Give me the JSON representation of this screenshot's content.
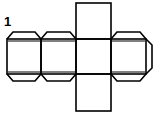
{
  "figure": {
    "label": "1",
    "stroke_color": "#000000",
    "background": "#ffffff"
  },
  "faces": [
    {
      "id": "face-top",
      "x": 76,
      "y": 3,
      "w": 35,
      "h": 36
    },
    {
      "id": "face-1",
      "x": 7,
      "y": 39,
      "w": 34,
      "h": 35
    },
    {
      "id": "face-2",
      "x": 41,
      "y": 39,
      "w": 35,
      "h": 35
    },
    {
      "id": "face-3",
      "x": 76,
      "y": 39,
      "w": 35,
      "h": 35
    },
    {
      "id": "face-4",
      "x": 111,
      "y": 39,
      "w": 35,
      "h": 35
    },
    {
      "id": "face-bottom",
      "x": 76,
      "y": 74,
      "w": 35,
      "h": 37
    }
  ],
  "tabs": [
    "face-1-top",
    "face-1-bottom",
    "face-2-top",
    "face-2-bottom",
    "face-4-top",
    "face-4-bottom",
    "face-4-right"
  ]
}
